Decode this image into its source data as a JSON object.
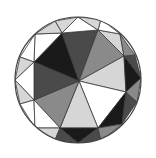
{
  "diagram": {
    "type": "circular faceted tiling (gem-cut style)",
    "canvas": {
      "width": 156,
      "height": 158
    },
    "circle": {
      "cx": 78,
      "cy": 80,
      "r": 63
    },
    "center": [
      79,
      81
    ],
    "colors": {
      "black": "#1a1a1a",
      "dark_gray": "#4a4a4a",
      "mid_gray": "#8a8a8a",
      "light_gray": "#d6d6d6",
      "white": "#ffffff",
      "stroke": "#3a3a3a"
    },
    "facets": [
      {
        "name": "top-left-black",
        "points": "79,81 62,33 34,62",
        "fill": "#1a1a1a"
      },
      {
        "name": "top-dark",
        "points": "79,81 62,33 98,30",
        "fill": "#4a4a4a"
      },
      {
        "name": "top-right-mid",
        "points": "79,81 98,30 124,56",
        "fill": "#8a8a8a"
      },
      {
        "name": "right-light",
        "points": "79,81 124,56 126,92",
        "fill": "#d6d6d6"
      },
      {
        "name": "bottom-right-white",
        "points": "79,81 126,92 98,128",
        "fill": "#ffffff"
      },
      {
        "name": "bottom-light",
        "points": "79,81 98,128 60,128",
        "fill": "#d6d6d6"
      },
      {
        "name": "bottom-left-mid",
        "points": "79,81 60,128 34,100",
        "fill": "#8a8a8a"
      },
      {
        "name": "left-dark",
        "points": "79,81 34,100 34,62",
        "fill": "#4a4a4a"
      },
      {
        "name": "rim-top-a",
        "points": "62,33 78,17 98,30",
        "fill": "#ffffff"
      },
      {
        "name": "rim-top-left-a",
        "points": "62,33 55,21 78,17",
        "fill": "#d6d6d6"
      },
      {
        "name": "rim-top-left-b",
        "points": "34,62 35,34 62,33",
        "fill": "#ffffff"
      },
      {
        "name": "rim-top-left-c",
        "points": "35,34 55,21 62,33",
        "fill": "#d6d6d6"
      },
      {
        "name": "rim-left-a",
        "points": "34,62 20,57 35,34",
        "fill": "#ffffff"
      },
      {
        "name": "rim-left-b",
        "points": "34,62 15,80 20,57",
        "fill": "#d6d6d6"
      },
      {
        "name": "rim-left-c",
        "points": "34,100 15,80 34,62",
        "fill": "#ffffff"
      },
      {
        "name": "rim-left-d",
        "points": "34,100 20,104 15,80",
        "fill": "#d6d6d6"
      },
      {
        "name": "rim-bottom-left-a",
        "points": "34,100 35,128 20,104",
        "fill": "#ffffff"
      },
      {
        "name": "rim-bottom-left-b",
        "points": "60,128 35,128 34,100",
        "fill": "#ffffff"
      },
      {
        "name": "rim-bottom-left-c",
        "points": "60,128 55,140 35,128",
        "fill": "#d6d6d6"
      },
      {
        "name": "rim-bottom-a",
        "points": "98,128 78,143 60,128",
        "fill": "#1a1a1a"
      },
      {
        "name": "rim-bottom-b",
        "points": "60,128 78,143 55,140",
        "fill": "#4a4a4a"
      },
      {
        "name": "rim-bottom-right-a",
        "points": "98,128 101,141 78,143",
        "fill": "#4a4a4a"
      },
      {
        "name": "rim-bottom-right-b",
        "points": "126,92 122,124 98,128",
        "fill": "#1a1a1a"
      },
      {
        "name": "rim-bottom-right-c",
        "points": "122,124 101,141 98,128",
        "fill": "#8a8a8a"
      },
      {
        "name": "rim-right-a",
        "points": "126,92 137,102 122,124",
        "fill": "#4a4a4a"
      },
      {
        "name": "rim-right-b",
        "points": "124,56 141,78 126,92",
        "fill": "#1a1a1a"
      },
      {
        "name": "rim-right-c",
        "points": "126,92 141,78 137,102",
        "fill": "#8a8a8a"
      },
      {
        "name": "rim-right-d",
        "points": "124,56 135,55 141,78",
        "fill": "#4a4a4a"
      },
      {
        "name": "rim-top-right-a",
        "points": "98,30 120,34 124,56",
        "fill": "#d6d6d6"
      },
      {
        "name": "rim-top-right-b",
        "points": "120,34 135,55 124,56",
        "fill": "#8a8a8a"
      },
      {
        "name": "rim-top-right-c",
        "points": "98,30 101,19 120,34",
        "fill": "#ffffff"
      },
      {
        "name": "rim-top-b",
        "points": "78,17 101,19 98,30",
        "fill": "#d6d6d6"
      }
    ]
  }
}
